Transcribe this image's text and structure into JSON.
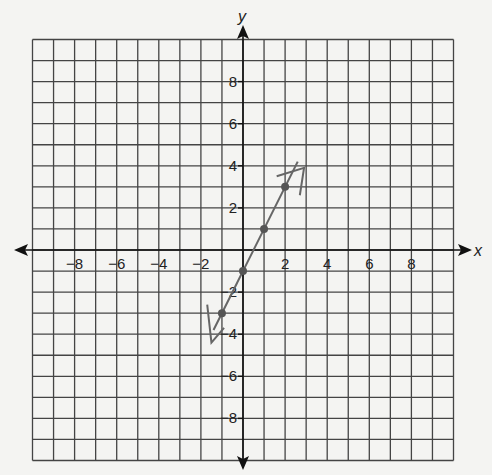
{
  "chart_data": {
    "type": "line",
    "title": "",
    "xlabel": "x",
    "ylabel": "y",
    "xlim": [
      -10,
      10
    ],
    "ylim": [
      -10,
      10
    ],
    "grid": true,
    "grid_step": 1,
    "x_ticks": [
      -8,
      -6,
      -4,
      -2,
      2,
      4,
      6,
      8
    ],
    "y_ticks": [
      8,
      6,
      4,
      2,
      -2,
      -4,
      -6,
      -8
    ],
    "x_tick_labels": [
      "−8",
      "−6",
      "−4",
      "−2",
      "2",
      "4",
      "6",
      "8"
    ],
    "y_tick_labels": [
      "8",
      "6",
      "4",
      "2",
      "−2",
      "−4",
      "−6",
      "−8"
    ],
    "series": [
      {
        "name": "hand-drawn line",
        "points": [
          [
            -1,
            -3
          ],
          [
            0,
            -1
          ],
          [
            1,
            1
          ],
          [
            2,
            3
          ]
        ],
        "equation": "y = 2x - 1",
        "extends_from": [
          -1.4,
          -3.8
        ],
        "extends_to": [
          2.6,
          4.2
        ],
        "color": "#666666"
      }
    ],
    "annotations": [
      "hand-drawn arrowhead near (2.5, 3.5)",
      "hand-drawn arrowhead near (-1.5, -4)"
    ]
  },
  "colors": {
    "background": "#f4f4f2",
    "grid": "#444444",
    "axis": "#111111",
    "line": "#666666"
  }
}
